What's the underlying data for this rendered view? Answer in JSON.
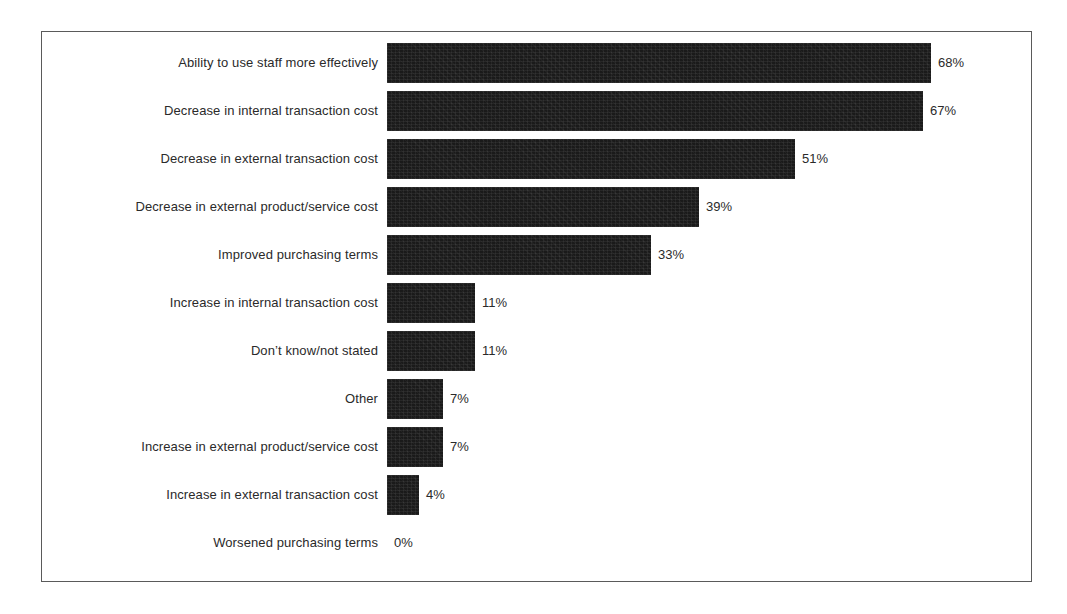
{
  "chart_data": {
    "type": "bar",
    "orientation": "horizontal",
    "title": "",
    "subtitle": "",
    "xlabel": "",
    "ylabel": "",
    "xlim": [
      0,
      68
    ],
    "grid": false,
    "legend": null,
    "value_suffix": "%",
    "categories": [
      "Ability to use staff more effectively",
      "Decrease in internal transaction cost",
      "Decrease in external transaction cost",
      "Decrease in external product/service cost",
      "Improved purchasing terms",
      "Increase in internal transaction cost",
      "Don’t know/not stated",
      "Other",
      "Increase in external product/service cost",
      "Increase in external transaction cost",
      "Worsened purchasing terms"
    ],
    "values": [
      68,
      67,
      51,
      39,
      33,
      11,
      11,
      7,
      7,
      4,
      0
    ],
    "value_labels": [
      "68%",
      "67%",
      "51%",
      "39%",
      "33%",
      "11%",
      "11%",
      "7%",
      "7%",
      "4%",
      "0%"
    ],
    "bar_color": "#1a1a1a",
    "frame_color": "#5a5a5a",
    "background": "#ffffff",
    "text_color": "#2a2a2a"
  },
  "figure": {
    "frame_visible": true,
    "axis_visible": false
  }
}
